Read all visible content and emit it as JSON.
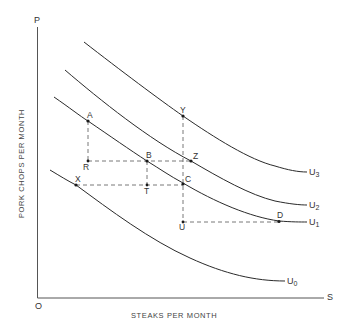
{
  "diagram": {
    "title": "",
    "axes": {
      "y_end_label": "P",
      "x_end_label": "S",
      "origin_label": "O",
      "x_title": "STEAKS PER MONTH",
      "y_title": "PORK CHOPS PER MONTH"
    },
    "curves": [
      {
        "name": "U",
        "sub": "3"
      },
      {
        "name": "U",
        "sub": "2"
      },
      {
        "name": "U",
        "sub": "1"
      },
      {
        "name": "U",
        "sub": "0"
      }
    ],
    "points": {
      "A": "A",
      "B": "B",
      "C": "C",
      "D": "D",
      "R": "R",
      "T": "T",
      "U": "U",
      "X": "X",
      "Y": "Y",
      "Z": "Z"
    },
    "colors": {
      "line": "#2a2a2a",
      "dash": "#555555",
      "text": "#333333"
    }
  }
}
